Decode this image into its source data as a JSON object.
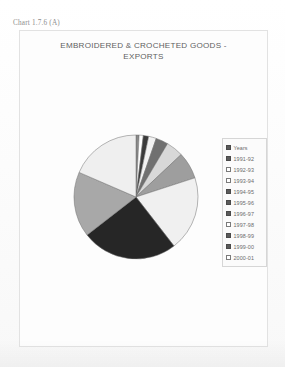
{
  "caption": "Chart 1.7.6 (A)",
  "chart_data": {
    "type": "pie",
    "title": "EMBROIDERED & CROCHETED GOODS - EXPORTS",
    "title_line1": "EMBROIDERED & CROCHETED GOODS -",
    "title_line2": "EXPORTS",
    "xlabel": "",
    "ylabel": "",
    "legend_position": "right",
    "grid": false,
    "categories": [
      "Years",
      "1991-92",
      "1992-93",
      "1993-94",
      "1994-95",
      "1995-96",
      "1996-97",
      "1997-98",
      "1998-99",
      "1999-00",
      "2000-01"
    ],
    "values": [
      0.8,
      1.1,
      1.4,
      2.0,
      3.2,
      4.5,
      7.0,
      19.5,
      25.0,
      17.0,
      18.5
    ],
    "colors": [
      "#8a8a8a",
      "#ffffff",
      "#3a3a3a",
      "#f2f2f2",
      "#707070",
      "#d8d8d8",
      "#9e9e9e",
      "#f0f0f0",
      "#262626",
      "#a8a8a8",
      "#efefef"
    ],
    "legend_swatch_styles": [
      "dark",
      "dark",
      "light",
      "light",
      "dark",
      "dark",
      "dark",
      "light",
      "dark",
      "dark",
      "light"
    ]
  }
}
